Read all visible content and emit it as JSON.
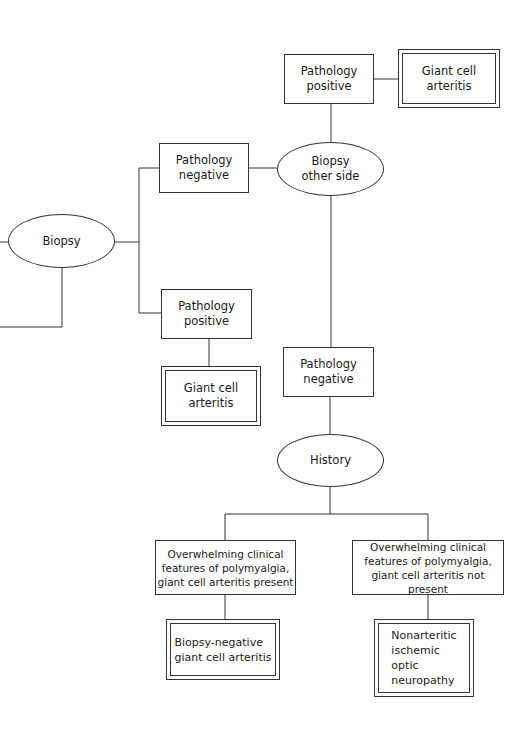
{
  "diagram": {
    "nodes": {
      "biopsy": "Biopsy",
      "path_neg_1": "Pathology\nnegative",
      "path_pos_1": "Pathology\npositive",
      "gca_1": "Giant cell\narteritis",
      "biopsy_other": "Biopsy\nother side",
      "path_pos_2": "Pathology\npositive",
      "gca_2": "Giant cell\narteritis",
      "path_neg_2": "Pathology\nnegative",
      "history": "History",
      "features_present": "Overwhelming  clinical\nfeatures of polymyalgia,\ngiant cell arteritis present",
      "features_absent": "Overwhelming  clinical\nfeatures of polymyalgia,\ngiant cell arteritis not present",
      "bn_gca": "Biopsy-negative\n  giant cell arteritis",
      "naion": "Nonarteritic\n  ischemic\n  optic\n  neuropathy"
    },
    "colors": {
      "line": "#333333",
      "text": "#1a1a1a",
      "background": "#ffffff"
    }
  }
}
